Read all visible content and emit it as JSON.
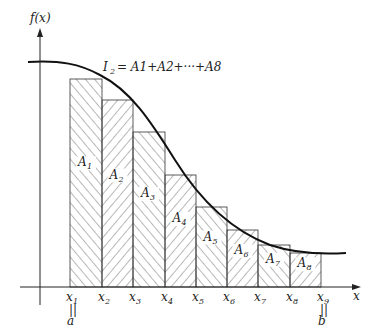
{
  "diagram": {
    "y_axis_label": "f(x)",
    "x_axis_label": "x",
    "formula": {
      "lhs": "I",
      "lhs_sub": "2",
      "text": "= A1+A2+···+A8"
    },
    "partitions": [
      {
        "label": "x",
        "sub": "1",
        "x": 70
      },
      {
        "label": "x",
        "sub": "2",
        "x": 102
      },
      {
        "label": "x",
        "sub": "3",
        "x": 133
      },
      {
        "label": "x",
        "sub": "4",
        "x": 165
      },
      {
        "label": "x",
        "sub": "5",
        "x": 196
      },
      {
        "label": "x",
        "sub": "6",
        "x": 227
      },
      {
        "label": "x",
        "sub": "7",
        "x": 258
      },
      {
        "label": "x",
        "sub": "8",
        "x": 290
      },
      {
        "label": "x",
        "sub": "9",
        "x": 321
      }
    ],
    "bounds": {
      "a": "a",
      "b": "b",
      "equals": "||"
    },
    "areas": [
      {
        "label": "A",
        "sub": "1",
        "top": 79
      },
      {
        "label": "A",
        "sub": "2",
        "top": 100
      },
      {
        "label": "A",
        "sub": "3",
        "top": 132
      },
      {
        "label": "A",
        "sub": "4",
        "top": 175
      },
      {
        "label": "A",
        "sub": "5",
        "top": 207
      },
      {
        "label": "A",
        "sub": "6",
        "top": 230
      },
      {
        "label": "A",
        "sub": "7",
        "top": 245
      },
      {
        "label": "A",
        "sub": "8",
        "top": 253
      }
    ]
  }
}
